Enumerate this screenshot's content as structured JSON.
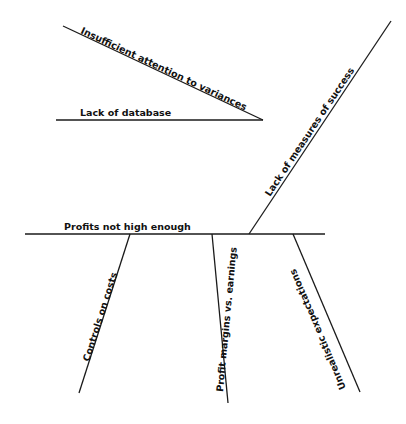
{
  "diagram": {
    "type": "fishbone",
    "effect": "Profits not high enough",
    "upper_causes": [
      {
        "label": "Lack of database"
      },
      {
        "label": "Insufficient attention to variances"
      },
      {
        "label": "Lack of measures  of success"
      }
    ],
    "lower_causes": [
      {
        "label": "Controls on costs"
      },
      {
        "label": "Profit margins vs. earnings"
      },
      {
        "label": "Unrealistic expectations"
      }
    ]
  }
}
